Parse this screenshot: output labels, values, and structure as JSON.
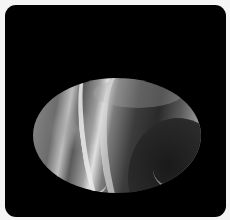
{
  "image": {
    "subject": "marbled-oval-stone",
    "background_color": "#000000",
    "page_color": "#f4f4f4",
    "stone_colors": [
      "#e0e0e0",
      "#9c9c9c",
      "#5a5a5a",
      "#2a2a2a"
    ]
  }
}
